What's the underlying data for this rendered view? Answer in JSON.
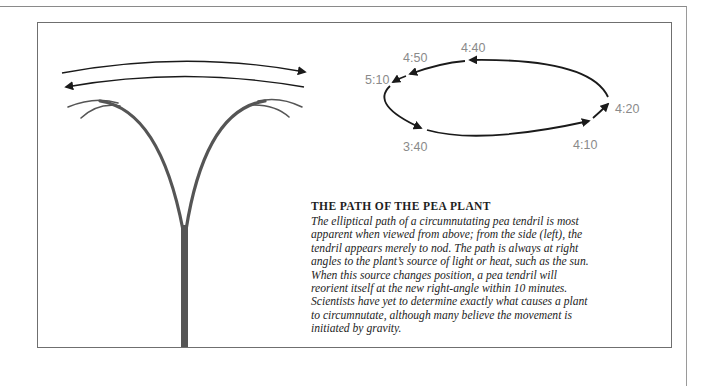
{
  "figure": {
    "side_view": {
      "description": "Pea tendril viewed from the side appears to nod back and forth",
      "arrows": [
        "right",
        "left"
      ]
    },
    "top_view": {
      "description": "Elliptical circumnutation path viewed from above",
      "time_labels": [
        {
          "id": "t340",
          "text": "3:40"
        },
        {
          "id": "t410",
          "text": "4:10"
        },
        {
          "id": "t420",
          "text": "4:20"
        },
        {
          "id": "t440",
          "text": "4:40"
        },
        {
          "id": "t450",
          "text": "4:50"
        },
        {
          "id": "t510",
          "text": "5:10"
        }
      ]
    },
    "colors": {
      "stem": "#555555",
      "arrow": "#1a1a1a",
      "label": "#8a8a8a",
      "frame": "#6f6f6f"
    }
  },
  "caption": {
    "title": "THE PATH OF THE PEA PLANT",
    "lines": [
      "The elliptical path of a circumnutating pea tendril is most",
      "apparent when viewed from above; from the side (left), the",
      "tendril appears merely to nod. The path is always at right",
      "angles to the plant’s source of light or heat, such as the sun.",
      "When this source changes position, a pea tendril will",
      "reorient itself at the new right-angle within 10 minutes.",
      "Scientists have yet to determine exactly what causes a plant",
      "to circumnutate, although many believe the movement is",
      "initiated by gravity."
    ]
  }
}
